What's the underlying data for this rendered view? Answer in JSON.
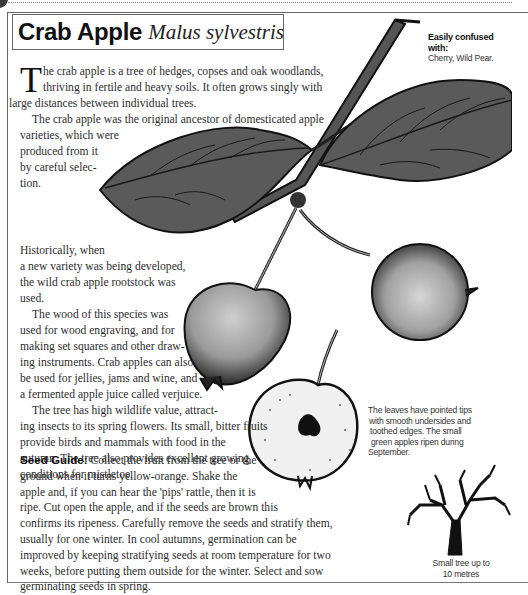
{
  "title": {
    "common_name": "Crab Apple",
    "latin_name": "Malus sylvestris"
  },
  "confusion": {
    "heading": "Easily confused with:",
    "species": "Cherry, Wild Pear."
  },
  "intro": {
    "dropcap": "T",
    "p1_lines": [
      "he crab apple is a tree of hedges, copses and oak woodlands,",
      "thriving in fertile and heavy soils. It often grows singly with",
      "large distances between individual trees."
    ],
    "p2_lines": [
      "The crab apple was the original ancestor of  domesticated apple",
      "varieties, which were",
      "produced from it",
      "by careful selec-",
      "tion."
    ]
  },
  "history": {
    "p1_lines": [
      "Historically, when",
      "a  new variety was being developed,",
      "the wild crab apple rootstock was",
      "used."
    ],
    "p2_lines": [
      "The wood of this species was",
      "used for wood engraving, and for",
      "making set squares and other draw-",
      "ing instruments. Crab apples can also",
      "be used for jellies, jams and wine, and",
      "a fermented apple juice called verjuice."
    ],
    "p3_lines": [
      "The tree has high wildlife value, attract-",
      "ing insects to its spring flowers. Its small, bitter fruits",
      "provide birds and mammals with food in the",
      "autumn. The tree also provides excellent growing",
      "conditions for mistletoe."
    ]
  },
  "seed_guide": {
    "label": "Seed Guide:",
    "lines": [
      " Collect the fruit from the tree or the",
      "ground when it turns yellow-orange. Shake the",
      "apple and, if you can hear the 'pips' rattle, then it is",
      "ripe. Cut open the apple, and if the seeds are brown this",
      "confirms its ripeness. Carefully remove the seeds and stratify them,",
      "usually for one winter. In cool autumns, germination can be",
      "improved by keeping stratifying seeds at room temperature for two",
      "weeks, before putting them outside for the winter. Select and sow",
      "germinating seeds in spring."
    ]
  },
  "leaf_note": {
    "lines": [
      "The leaves have pointed tips",
      "with smooth undersides and",
      "toothed edges. The small",
      "green apples ripen during",
      "September."
    ]
  },
  "tree_caption": {
    "lines": [
      "Small tree up to",
      "10 metres"
    ]
  },
  "illustrations": {
    "items": [
      "branch-with-leaves-illustration",
      "crab-apple-fruit-left",
      "crab-apple-fruit-right",
      "crab-apple-cross-section",
      "tree-silhouette-icon"
    ]
  },
  "colors": {
    "leaf": "#5a5a5a",
    "leaf_dark": "#1e1e1e",
    "fruit": "#9a9a9a",
    "frame": "#666666"
  }
}
